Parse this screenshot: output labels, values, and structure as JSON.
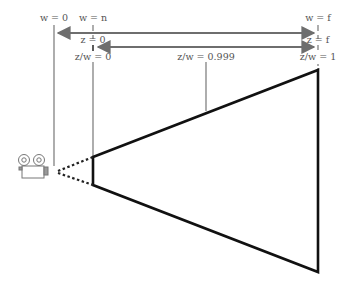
{
  "diagram": {
    "labels": {
      "w0": "w = 0",
      "wn": "w = n",
      "wf": "w = f",
      "z0": "z = 0",
      "zf": "z = f",
      "zw0": "z/w = 0",
      "zw1": "z/w = 1",
      "zw_mid": "z/w = 0.999"
    },
    "icons": {
      "camera": "movie-camera-icon"
    },
    "colors": {
      "guide_lines": "#777777",
      "frustum": "#111111",
      "text": "#555555"
    }
  }
}
